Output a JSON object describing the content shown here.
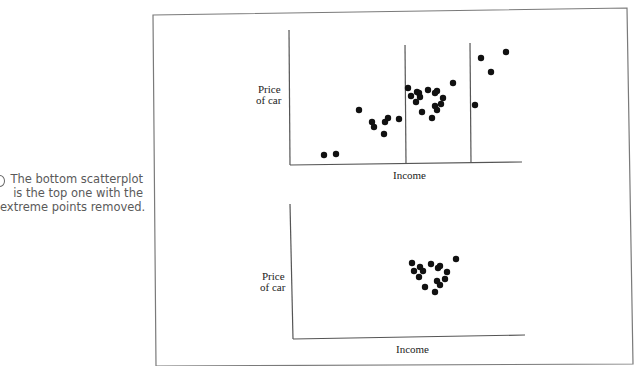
{
  "caption": {
    "lines": [
      "The bottom scatterplot",
      "is the top one with the",
      "extreme points removed."
    ]
  },
  "chart_data": [
    {
      "type": "scatter",
      "title": "",
      "xlabel": "Income",
      "ylabel": "Price of car",
      "ylabel_lines": [
        "Price",
        "of car"
      ],
      "grid": false,
      "legend": null,
      "annotations": [
        "Two vertical divider lines split the x-range into three regions"
      ],
      "dividers_x_px": [
        406,
        471
      ],
      "points_px": [
        [
          324,
          155
        ],
        [
          336,
          154
        ],
        [
          359,
          110
        ],
        [
          372,
          122
        ],
        [
          374,
          127
        ],
        [
          384,
          134
        ],
        [
          385,
          122
        ],
        [
          388,
          118
        ],
        [
          399,
          119
        ],
        [
          408,
          88
        ],
        [
          411,
          96
        ],
        [
          417,
          92
        ],
        [
          419,
          93
        ],
        [
          420,
          97
        ],
        [
          416,
          102
        ],
        [
          428,
          90
        ],
        [
          435,
          93
        ],
        [
          437,
          91
        ],
        [
          443,
          98
        ],
        [
          441,
          104
        ],
        [
          435,
          106
        ],
        [
          437,
          110
        ],
        [
          422,
          112
        ],
        [
          432,
          118
        ],
        [
          453,
          83
        ],
        [
          481,
          58
        ],
        [
          506,
          52
        ],
        [
          491,
          72
        ],
        [
          475,
          105
        ]
      ]
    },
    {
      "type": "scatter",
      "title": "",
      "xlabel": "Income",
      "ylabel": "Price of car",
      "ylabel_lines": [
        "Price",
        "of car"
      ],
      "grid": false,
      "legend": null,
      "points_px": [
        [
          412,
          263
        ],
        [
          414,
          271
        ],
        [
          420,
          267
        ],
        [
          423,
          271
        ],
        [
          419,
          277
        ],
        [
          431,
          264
        ],
        [
          438,
          268
        ],
        [
          440,
          266
        ],
        [
          447,
          272
        ],
        [
          445,
          279
        ],
        [
          437,
          281
        ],
        [
          440,
          285
        ],
        [
          425,
          287
        ],
        [
          435,
          292
        ],
        [
          456,
          259
        ]
      ]
    }
  ],
  "colors": {
    "point": "#111111",
    "axis": "#555555",
    "frame": "#777777",
    "caption": "#5a5a5a"
  }
}
